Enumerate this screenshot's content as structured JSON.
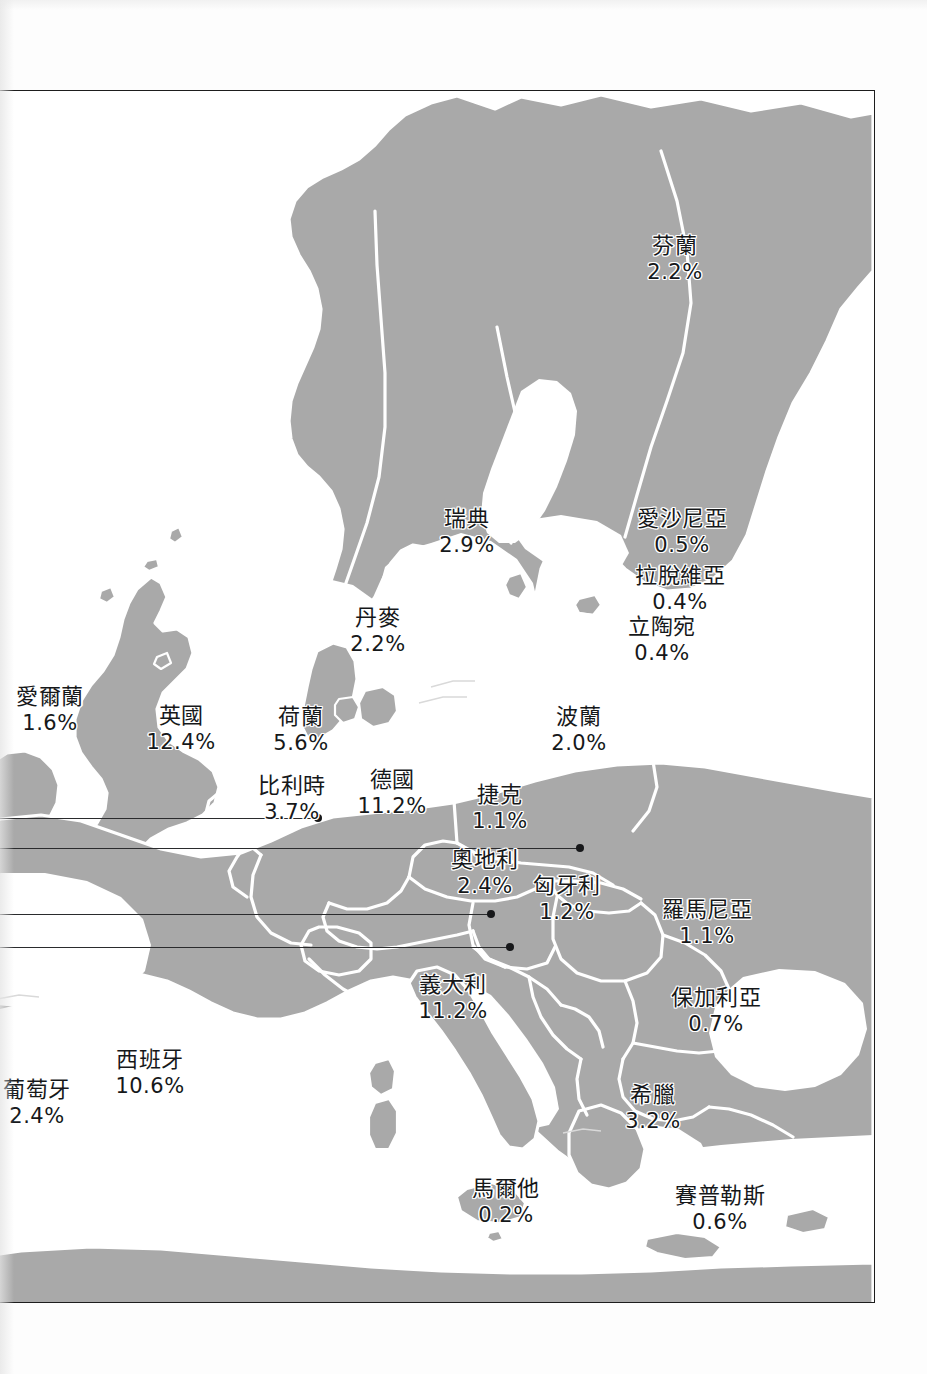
{
  "map": {
    "title": "Europe country share map",
    "land_color": "#a9a9a9",
    "border_color": "#ffffff",
    "sea_color": "#ffffff",
    "frame_color": "#1d1d1d",
    "label_color": "#16181a",
    "leader_line_color": "#2a2b2d"
  },
  "chart_data": {
    "type": "map",
    "title": "",
    "value_unit": "%",
    "categories": [
      "芬蘭",
      "瑞典",
      "愛沙尼亞",
      "拉脫維亞",
      "立陶宛",
      "丹麥",
      "愛爾蘭",
      "英國",
      "荷蘭",
      "比利時",
      "德國",
      "波蘭",
      "捷克",
      "奧地利",
      "匈牙利",
      "羅馬尼亞",
      "保加利亞",
      "義大利",
      "希臘",
      "西班牙",
      "葡萄牙",
      "馬爾他",
      "賽普勒斯"
    ],
    "values": [
      2.2,
      2.9,
      0.5,
      0.4,
      0.4,
      2.2,
      1.6,
      12.4,
      5.6,
      3.7,
      11.2,
      2.0,
      1.1,
      2.4,
      1.2,
      1.1,
      0.7,
      11.2,
      3.2,
      10.6,
      2.4,
      0.2,
      0.6
    ]
  },
  "countries": [
    {
      "id": "finland",
      "name": "芬蘭",
      "value": "2.2%",
      "x": 674,
      "y": 232
    },
    {
      "id": "sweden",
      "name": "瑞典",
      "value": "2.9%",
      "x": 466,
      "y": 505
    },
    {
      "id": "estonia",
      "name": "愛沙尼亞",
      "value": "0.5%",
      "x": 681,
      "y": 505
    },
    {
      "id": "latvia",
      "name": "拉脫維亞",
      "value": "0.4%",
      "x": 679,
      "y": 562
    },
    {
      "id": "lithuania",
      "name": "立陶宛",
      "value": "0.4%",
      "x": 661,
      "y": 613
    },
    {
      "id": "denmark",
      "name": "丹麥",
      "value": "2.2%",
      "x": 377,
      "y": 604
    },
    {
      "id": "ireland",
      "name": "愛爾蘭",
      "value": "1.6%",
      "x": 49,
      "y": 683
    },
    {
      "id": "uk",
      "name": "英國",
      "value": "12.4%",
      "x": 180,
      "y": 702
    },
    {
      "id": "netherlands",
      "name": "荷蘭",
      "value": "5.6%",
      "x": 300,
      "y": 703
    },
    {
      "id": "belgium",
      "name": "比利時",
      "value": "3.7%",
      "x": 291,
      "y": 772
    },
    {
      "id": "germany",
      "name": "德國",
      "value": "11.2%",
      "x": 391,
      "y": 766
    },
    {
      "id": "poland",
      "name": "波蘭",
      "value": "2.0%",
      "x": 578,
      "y": 703
    },
    {
      "id": "czech",
      "name": "捷克",
      "value": "1.1%",
      "x": 499,
      "y": 781
    },
    {
      "id": "austria",
      "name": "奧地利",
      "value": "2.4%",
      "x": 484,
      "y": 846
    },
    {
      "id": "hungary",
      "name": "匈牙利",
      "value": "1.2%",
      "x": 566,
      "y": 872
    },
    {
      "id": "romania",
      "name": "羅馬尼亞",
      "value": "1.1%",
      "x": 706,
      "y": 896
    },
    {
      "id": "bulgaria",
      "name": "保加利亞",
      "value": "0.7%",
      "x": 715,
      "y": 984
    },
    {
      "id": "italy",
      "name": "義大利",
      "value": "11.2%",
      "x": 452,
      "y": 971
    },
    {
      "id": "greece",
      "name": "希臘",
      "value": "3.2%",
      "x": 652,
      "y": 1081
    },
    {
      "id": "spain",
      "name": "西班牙",
      "value": "10.6%",
      "x": 149,
      "y": 1046
    },
    {
      "id": "portugal",
      "name": "葡萄牙",
      "value": "2.4%",
      "x": 36,
      "y": 1076
    },
    {
      "id": "malta",
      "name": "馬爾他",
      "value": "0.2%",
      "x": 505,
      "y": 1175
    },
    {
      "id": "cyprus",
      "name": "賽普勒斯",
      "value": "0.6%",
      "x": 719,
      "y": 1182
    }
  ],
  "leaders": [
    {
      "id": "leader-1",
      "dot_x": 317,
      "dot_y": 817,
      "y": 817
    },
    {
      "id": "leader-2",
      "dot_x": 579,
      "dot_y": 847,
      "y": 847
    },
    {
      "id": "leader-3",
      "dot_x": 490,
      "dot_y": 913,
      "y": 913
    },
    {
      "id": "leader-4",
      "dot_x": 509,
      "dot_y": 946,
      "y": 946
    }
  ]
}
